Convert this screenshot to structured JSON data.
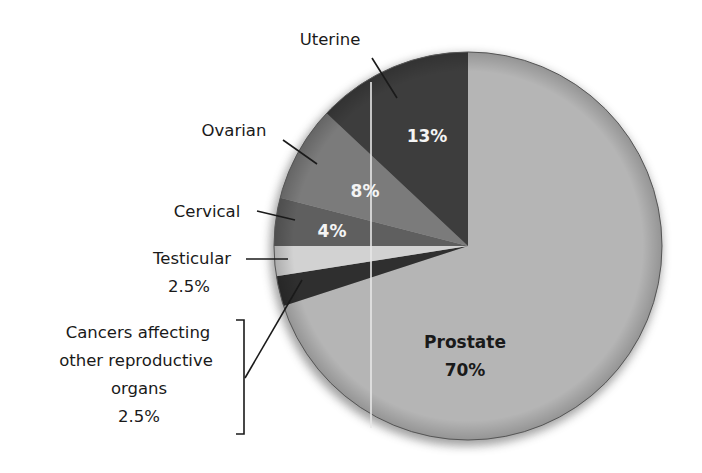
{
  "chart_data": {
    "type": "pie",
    "title": "",
    "start_angle_deg": 0,
    "direction": "clockwise",
    "slices": [
      {
        "name": "Prostate",
        "value": 70,
        "label": "Prostate",
        "pct_label": "70%",
        "color": "#b5b5b5"
      },
      {
        "name": "Cancers affecting other reproductive organs",
        "value": 2.5,
        "label_lines": [
          "Cancers affecting",
          "other reproductive",
          "organs",
          "2.5%"
        ],
        "color": "#2f2f2f"
      },
      {
        "name": "Testicular",
        "value": 2.5,
        "label": "Testicular",
        "pct_label": "2.5%",
        "color": "#d2d2d2"
      },
      {
        "name": "Cervical",
        "value": 4,
        "label": "Cervical",
        "pct_label": "4%",
        "color": "#5f5f5f"
      },
      {
        "name": "Ovarian",
        "value": 8,
        "label": "Ovarian",
        "pct_label": "8%",
        "color": "#7b7b7b"
      },
      {
        "name": "Uterine",
        "value": 13,
        "label": "Uterine",
        "pct_label": "13%",
        "color": "#3d3d3d"
      }
    ],
    "categories": [
      "Prostate",
      "Cancers affecting other reproductive organs",
      "Testicular",
      "Cervical",
      "Ovarian",
      "Uterine"
    ],
    "values": [
      70,
      2.5,
      2.5,
      4,
      8,
      13
    ],
    "legend": "none (direct labels with leader lines)"
  },
  "labels": {
    "uterine": "Uterine",
    "uterine_pct": "13%",
    "ovarian": "Ovarian",
    "ovarian_pct": "8%",
    "cervical": "Cervical",
    "cervical_pct": "4%",
    "testicular": "Testicular",
    "testicular_pct": "2.5%",
    "other_line1": "Cancers affecting",
    "other_line2": "other reproductive",
    "other_line3": "organs",
    "other_pct": "2.5%",
    "prostate": "Prostate",
    "prostate_pct": "70%"
  }
}
